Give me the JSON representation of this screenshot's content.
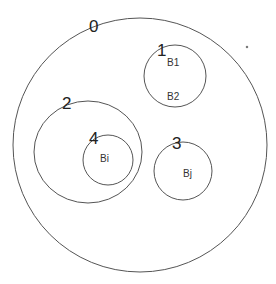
{
  "diagram": {
    "type": "nested-circles",
    "regions": [
      {
        "id": "0",
        "label": "0",
        "contents": []
      },
      {
        "id": "1",
        "label": "1",
        "contents": [
          "B1",
          "B2"
        ]
      },
      {
        "id": "2",
        "label": "2",
        "contents": []
      },
      {
        "id": "3",
        "label": "3",
        "contents": [
          "Bj"
        ]
      },
      {
        "id": "4",
        "label": "4",
        "contents": [
          "Bi"
        ]
      }
    ]
  }
}
